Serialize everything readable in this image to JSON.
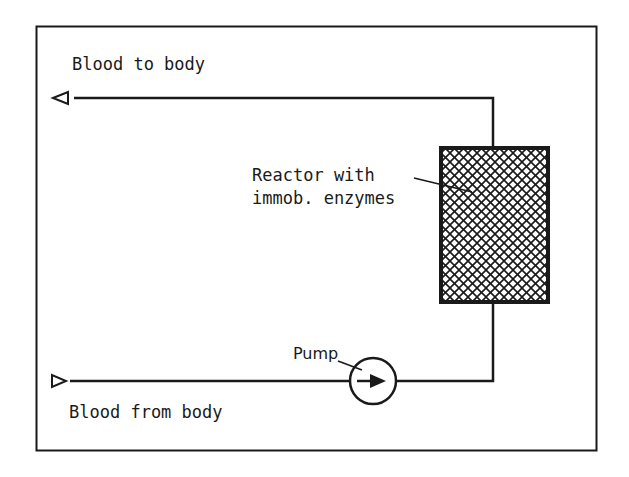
{
  "diagram": {
    "colors": {
      "stroke": "#1a1a1a",
      "background": "#ffffff"
    },
    "labels": {
      "blood_to_body": "Blood to body",
      "blood_from_body": "Blood from body",
      "reactor_line1": "Reactor with",
      "reactor_line2": "immob. enzymes",
      "pump": "Pump"
    },
    "components": [
      {
        "id": "outlet-arrow",
        "type": "open-arrow-left",
        "label_ref": "blood_to_body"
      },
      {
        "id": "reactor",
        "type": "crosshatched-rectangle",
        "label_ref": "reactor_line1"
      },
      {
        "id": "pump",
        "type": "circle-with-arrow",
        "label_ref": "pump"
      },
      {
        "id": "inlet-arrow",
        "type": "open-arrow-right",
        "label_ref": "blood_from_body"
      }
    ],
    "flow": [
      "Blood from body",
      "Pump",
      "Reactor with immob. enzymes",
      "Blood to body"
    ]
  }
}
